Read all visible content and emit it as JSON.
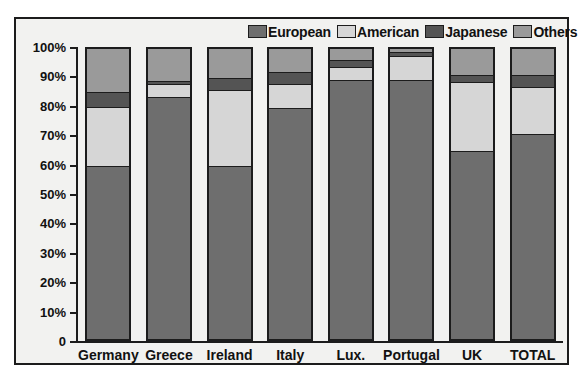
{
  "chart_data": {
    "type": "bar",
    "subtype": "stacked-percentage",
    "title": "",
    "xlabel": "",
    "ylabel": "",
    "ylim": [
      0,
      100
    ],
    "grid": false,
    "legend_position": "top-right",
    "categories": [
      "Germany",
      "Greece",
      "Ireland",
      "Italy",
      "Lux.",
      "Portugal",
      "UK",
      "TOTAL"
    ],
    "tick_labels": [
      "0",
      "10%",
      "20%",
      "30%",
      "40%",
      "50%",
      "60%",
      "70%",
      "80%",
      "90%",
      "100%"
    ],
    "tick_values": [
      0,
      10,
      20,
      30,
      40,
      50,
      60,
      70,
      80,
      90,
      100
    ],
    "series": [
      {
        "name": "European",
        "color": "#6e6e6e",
        "values": [
          60,
          84,
          60,
          80,
          90,
          90,
          65,
          71
        ]
      },
      {
        "name": "American",
        "color": "#d6d6d6",
        "values": [
          20,
          4,
          26,
          8,
          4,
          8,
          24,
          16
        ]
      },
      {
        "name": "Japanese",
        "color": "#545454",
        "values": [
          5,
          1,
          4,
          4,
          2,
          1,
          2,
          4
        ]
      },
      {
        "name": "Others",
        "color": "#9a9a9a",
        "values": [
          15,
          11,
          10,
          8,
          4,
          1,
          9,
          9
        ]
      }
    ]
  },
  "legend": {
    "entries": [
      {
        "label": "European",
        "color": "#6e6e6e"
      },
      {
        "label": "American",
        "color": "#d6d6d6"
      },
      {
        "label": "Japanese",
        "color": "#545454"
      },
      {
        "label": "Others",
        "color": "#9a9a9a"
      }
    ]
  },
  "axis": {
    "y_labels": [
      "100%",
      "90%",
      "80%",
      "70%",
      "60%",
      "50%",
      "40%",
      "30%",
      "20%",
      "10%",
      "0"
    ],
    "x_labels": [
      "Germany",
      "Greece",
      "Ireland",
      "Italy",
      "Lux.",
      "Portugal",
      "UK",
      "TOTAL"
    ]
  },
  "colors": {
    "european": "#6e6e6e",
    "american": "#d6d6d6",
    "japanese": "#545454",
    "others": "#9a9a9a",
    "frame": "#1c1c1c",
    "background": "#f2f2f0"
  }
}
